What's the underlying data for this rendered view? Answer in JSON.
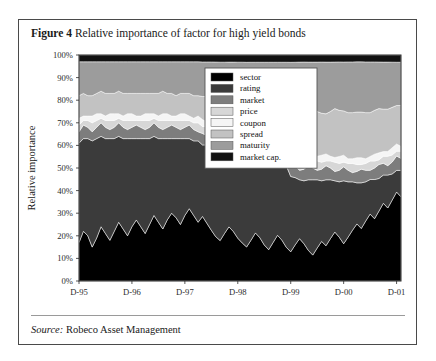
{
  "figure": {
    "label": "Figure 4",
    "title": "Relative importance of factor for high yield bonds",
    "source_label": "Source:",
    "source_text": "Robeco Asset Management"
  },
  "chart_data": {
    "type": "area",
    "stacked": true,
    "title": "Relative importance of factor for high yield bonds",
    "xlabel": "",
    "ylabel": "Relative importance",
    "ylim": [
      0,
      100
    ],
    "ytick_labels": [
      "0%",
      "10%",
      "20%",
      "30%",
      "40%",
      "50%",
      "60%",
      "70%",
      "80%",
      "90%",
      "100%"
    ],
    "ytick_values": [
      0,
      10,
      20,
      30,
      40,
      50,
      60,
      70,
      80,
      90,
      100
    ],
    "xtick_labels": [
      "D-95",
      "D-96",
      "D-97",
      "D-98",
      "D-99",
      "D-00",
      "D-01"
    ],
    "xtick_values": [
      0,
      12,
      24,
      36,
      48,
      60,
      72
    ],
    "x": [
      0,
      1,
      2,
      3,
      4,
      5,
      6,
      7,
      8,
      9,
      10,
      11,
      12,
      13,
      14,
      15,
      16,
      17,
      18,
      19,
      20,
      21,
      22,
      23,
      24,
      25,
      26,
      27,
      28,
      29,
      30,
      31,
      32,
      33,
      34,
      35,
      36,
      37,
      38,
      39,
      40,
      41,
      42,
      43,
      44,
      45,
      46,
      47,
      48,
      49,
      50,
      51,
      52,
      53,
      54,
      55,
      56,
      57,
      58,
      59,
      60,
      61,
      62,
      63,
      64,
      65,
      66,
      67,
      68,
      69,
      70,
      71,
      72,
      73
    ],
    "grid": false,
    "legend_position": "upper-right",
    "series": [
      {
        "name": "sector",
        "color": "#000000",
        "values": [
          17,
          22,
          20,
          15,
          19,
          24,
          21,
          18,
          22,
          26,
          23,
          20,
          24,
          27,
          24,
          21,
          25,
          29,
          26,
          23,
          27,
          30,
          28,
          25,
          29,
          32,
          29,
          26,
          28,
          25,
          22,
          19,
          17,
          20,
          23,
          21,
          18,
          16,
          14,
          17,
          20,
          18,
          15,
          13,
          16,
          19,
          17,
          14,
          12,
          15,
          18,
          16,
          13,
          11,
          14,
          17,
          15,
          18,
          21,
          19,
          16,
          19,
          22,
          25,
          23,
          26,
          29,
          27,
          30,
          33,
          31,
          34,
          37,
          35
        ]
      },
      {
        "name": "rating",
        "color": "#3b3b3b",
        "values": [
          44,
          41,
          43,
          47,
          44,
          40,
          42,
          45,
          41,
          38,
          40,
          43,
          39,
          36,
          39,
          42,
          38,
          35,
          37,
          40,
          36,
          33,
          35,
          38,
          34,
          31,
          33,
          36,
          31,
          34,
          37,
          39,
          36,
          33,
          30,
          32,
          35,
          37,
          34,
          31,
          28,
          30,
          33,
          35,
          32,
          29,
          31,
          34,
          31,
          28,
          25,
          27,
          30,
          32,
          29,
          26,
          28,
          25,
          22,
          24,
          27,
          24,
          21,
          18,
          20,
          17,
          15,
          17,
          14,
          12,
          14,
          11,
          9,
          11
        ]
      },
      {
        "name": "market",
        "color": "#7d7d7d",
        "values": [
          5,
          6,
          5,
          4,
          5,
          6,
          5,
          4,
          5,
          6,
          5,
          4,
          5,
          6,
          5,
          4,
          5,
          6,
          5,
          4,
          5,
          6,
          5,
          4,
          5,
          6,
          5,
          4,
          5,
          4,
          4,
          5,
          6,
          5,
          4,
          5,
          6,
          5,
          4,
          5,
          6,
          5,
          4,
          5,
          6,
          5,
          4,
          5,
          6,
          5,
          4,
          5,
          6,
          5,
          4,
          5,
          6,
          5,
          4,
          5,
          6,
          5,
          4,
          5,
          6,
          5,
          4,
          5,
          6,
          5,
          4,
          5,
          6,
          5
        ]
      },
      {
        "name": "price",
        "color": "#d7d7d7",
        "values": [
          3,
          2,
          3,
          4,
          3,
          2,
          3,
          4,
          3,
          2,
          3,
          4,
          3,
          2,
          3,
          4,
          3,
          2,
          3,
          4,
          3,
          2,
          3,
          4,
          3,
          2,
          3,
          4,
          3,
          4,
          4,
          3,
          2,
          3,
          4,
          3,
          2,
          3,
          4,
          3,
          2,
          3,
          4,
          3,
          2,
          3,
          4,
          3,
          2,
          3,
          4,
          3,
          2,
          3,
          4,
          3,
          2,
          3,
          4,
          3,
          2,
          3,
          4,
          3,
          2,
          3,
          4,
          3,
          2,
          3,
          4,
          3,
          2,
          3
        ]
      },
      {
        "name": "coupon",
        "color": "#f5f5f5",
        "values": [
          3,
          2,
          2,
          3,
          3,
          2,
          2,
          3,
          3,
          2,
          2,
          3,
          3,
          2,
          2,
          3,
          3,
          2,
          2,
          3,
          3,
          2,
          2,
          3,
          3,
          2,
          2,
          3,
          3,
          2,
          2,
          3,
          3,
          2,
          2,
          3,
          3,
          2,
          2,
          3,
          3,
          2,
          2,
          3,
          3,
          2,
          2,
          3,
          3,
          2,
          2,
          3,
          3,
          2,
          2,
          3,
          3,
          2,
          2,
          3,
          3,
          2,
          2,
          3,
          3,
          2,
          2,
          3,
          3,
          2,
          2,
          3,
          3,
          2
        ]
      },
      {
        "name": "spread",
        "color": "#c2c2c2",
        "values": [
          10,
          10,
          9,
          9,
          9,
          10,
          10,
          9,
          9,
          10,
          10,
          9,
          9,
          10,
          10,
          9,
          9,
          9,
          10,
          10,
          9,
          10,
          9,
          9,
          9,
          10,
          10,
          9,
          10,
          11,
          11,
          10,
          11,
          12,
          12,
          11,
          11,
          12,
          13,
          13,
          13,
          13,
          13,
          13,
          14,
          14,
          14,
          14,
          16,
          17,
          18,
          18,
          18,
          18,
          19,
          18,
          17,
          19,
          21,
          20,
          19,
          20,
          20,
          20,
          20,
          20,
          19,
          19,
          19,
          18,
          18,
          17,
          16,
          17
        ]
      },
      {
        "name": "maturity",
        "color": "#9c9c9c",
        "values": [
          15,
          14,
          15,
          15,
          14,
          13,
          14,
          14,
          14,
          13,
          14,
          14,
          14,
          14,
          14,
          14,
          14,
          14,
          14,
          13,
          14,
          14,
          15,
          14,
          14,
          14,
          15,
          15,
          15,
          15,
          15,
          15,
          17,
          17,
          18,
          18,
          17,
          17,
          19,
          19,
          19,
          20,
          20,
          19,
          18,
          19,
          19,
          18,
          20,
          21,
          22,
          22,
          21,
          22,
          21,
          22,
          22,
          21,
          20,
          21,
          21,
          22,
          22,
          22,
          22,
          22,
          22,
          21,
          20,
          20,
          20,
          19,
          18,
          18
        ]
      },
      {
        "name": "market cap.",
        "color": "#111111",
        "values": [
          3,
          3,
          3,
          3,
          3,
          3,
          3,
          3,
          3,
          3,
          3,
          3,
          3,
          3,
          3,
          3,
          3,
          3,
          3,
          3,
          3,
          3,
          3,
          3,
          3,
          3,
          3,
          3,
          3,
          3,
          3,
          3,
          3,
          3,
          3,
          3,
          3,
          3,
          3,
          3,
          3,
          3,
          3,
          3,
          3,
          3,
          3,
          3,
          3,
          3,
          3,
          3,
          3,
          3,
          3,
          3,
          3,
          3,
          3,
          3,
          3,
          3,
          3,
          3,
          3,
          3,
          3,
          3,
          3,
          3,
          3,
          3,
          3,
          3
        ]
      }
    ]
  }
}
